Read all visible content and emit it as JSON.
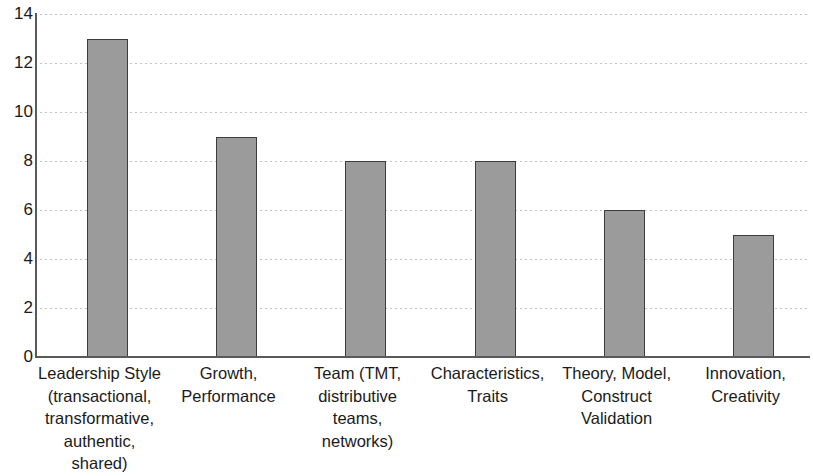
{
  "chart_data": {
    "type": "bar",
    "title": "",
    "subtitle": "",
    "xlabel": "",
    "ylabel": "",
    "ylim": [
      0,
      14
    ],
    "ytick_step": 2,
    "yticks": [
      "14",
      "12",
      "10",
      "8",
      "6",
      "4",
      "2",
      "0"
    ],
    "grid": true,
    "legend": false,
    "categories": [
      "Leadership Style (transactional, transformative, authentic, shared)",
      "Growth, Performance",
      "Team (TMT, distributive teams, networks)",
      "Characteristics, Traits",
      "Theory, Model, Construct Validation",
      "Innovation, Creativity"
    ],
    "values": [
      13,
      9,
      8,
      8,
      6,
      5
    ],
    "bar_color": "#9b9b9b",
    "bar_border_color": "#3d3d3d",
    "axis_color": "#5a5a5a",
    "grid_color": "#c4c4c4",
    "background": "#ffffff"
  }
}
